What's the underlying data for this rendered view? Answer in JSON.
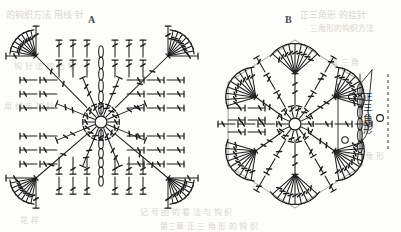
{
  "page": {
    "width": 401,
    "height": 232,
    "background_color": "#fdfdfb",
    "ink_color": "#1d1d1d"
  },
  "labels": [
    {
      "id": "A",
      "text": "A",
      "x": 88,
      "y": 14,
      "caption": "square motif diagram label"
    },
    {
      "id": "B",
      "text": "B",
      "x": 285,
      "y": 14,
      "caption": "hexagon motif diagram label"
    }
  ],
  "annotations": [
    {
      "id": "equilateral-triangle",
      "text": "正三角形",
      "reading": "equilateral triangle",
      "orientation": "vertical",
      "x": 362,
      "y": 92,
      "font_size": 9.5
    }
  ],
  "legend_symbols": [
    {
      "name": "chain-stitch-circle",
      "shape": "circle",
      "x": 352,
      "y": 97,
      "r": 3.4
    },
    {
      "name": "chain-stitch-circle",
      "shape": "circle",
      "x": 380,
      "y": 118,
      "r": 3.4
    },
    {
      "name": "chain-stitch-circle",
      "shape": "circle",
      "x": 345,
      "y": 140,
      "r": 3.2
    }
  ],
  "diagrams": [
    {
      "id": "diagram-a",
      "label": "A",
      "shape": "square",
      "center": {
        "x": 101,
        "y": 122
      },
      "bounds": {
        "x": 14,
        "y": 34,
        "width": 176,
        "height": 166
      },
      "center_ring_radius": 6,
      "rounds": 7,
      "corner_fans": 4,
      "stitch_type": "treble-crochet",
      "description": "Square granny-style motif worked in the round from a center ring with corner fan increases"
    },
    {
      "id": "diagram-b",
      "label": "B",
      "shape": "hexagon",
      "center": {
        "x": 295,
        "y": 124
      },
      "bounds": {
        "x": 212,
        "y": 30,
        "width": 136,
        "height": 182
      },
      "center_ring_radius": 6,
      "rounds": 6,
      "corner_fans": 6,
      "stitch_type": "treble-crochet",
      "has_chain_loop_edge": true,
      "description": "Hexagonal motif worked in the round from a center ring with six corner fans and a chain-stitch edge"
    }
  ],
  "ghost_text": [
    {
      "text": "的钩织方法 用线 针",
      "x": 6,
      "y": 8,
      "size": 9
    },
    {
      "text": "正三角形 的挂针",
      "x": 300,
      "y": 8,
      "size": 9
    },
    {
      "text": "三角形的钩织方法",
      "x": 310,
      "y": 22,
      "size": 8
    },
    {
      "text": "钩 针 法 的 记 号",
      "x": 14,
      "y": 60,
      "size": 8
    },
    {
      "text": "第 三 角",
      "x": 330,
      "y": 56,
      "size": 8
    },
    {
      "text": "用 线 与 钩 针",
      "x": 4,
      "y": 100,
      "size": 8
    },
    {
      "text": "的 三 角 形",
      "x": 344,
      "y": 150,
      "size": 8
    },
    {
      "text": "记 号 图 的 看 法 与 钩 织",
      "x": 140,
      "y": 206,
      "size": 8
    },
    {
      "text": "第三章 正 三 角 形 的 钩 织",
      "x": 160,
      "y": 220,
      "size": 8
    },
    {
      "text": "花 样",
      "x": 20,
      "y": 214,
      "size": 8
    }
  ]
}
